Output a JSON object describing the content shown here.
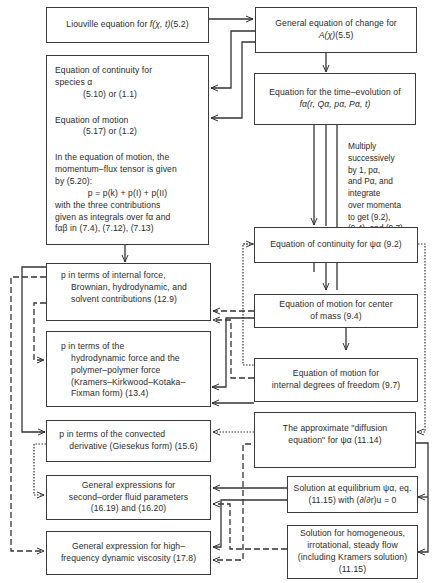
{
  "diagram": {
    "type": "flowchart",
    "nodes": {
      "liouville": {
        "text": "Liouville equation for",
        "sym": "f(χ, t)",
        "ref": "(5.2)"
      },
      "general_change": {
        "line1": "General equation of change for",
        "sym": "A(χ)",
        "ref": "(5.5)"
      },
      "continuity_species": {
        "line1": "Equation of continuity for",
        "line2": "species α",
        "ref": "(5.10) or (1.1)"
      },
      "motion": {
        "line1": "Equation of motion",
        "ref": "(5.17) or (1.2)"
      },
      "momentum_flux": {
        "line1": "In the equation of motion, the",
        "line2": "momentum–flux tensor is given",
        "line3": "by (5.20):",
        "formula": "p = p(k) + p(I) + p(II)",
        "line4": "with the three contributions",
        "line5": "given as integrals over fα and",
        "line6": "fαβ in (7.4), (7.12), (7.13)"
      },
      "time_evolution": {
        "line1": "Equation for the time–evolution of",
        "line2": "fα(r, Qα, pα, Pα, t)"
      },
      "multiply_note": {
        "lines": [
          "Multiply",
          "successively",
          "by 1, pα,",
          "and Pα, and",
          "integrate",
          "over momenta",
          "to get (9.2),",
          "(9.4), and (9.7)"
        ]
      },
      "p_internal": {
        "line1": "p in terms of internal force,",
        "line2": "Brownian, hydrodynamic, and",
        "line3": "solvent contributions (12.9)"
      },
      "continuity_psi": {
        "text": "Equation of continuity for ψα (9.2)"
      },
      "motion_center": {
        "line1": "Equation of motion for center",
        "line2": "of mass (9.4)"
      },
      "p_hydro": {
        "line1": "p in terms of the",
        "line2": "hydrodynamic force and the",
        "line3": "polymer–polymer force",
        "line4": "(Kramers–Kirkwood–Kotaka–",
        "line5": "Fixman form) (13.4)"
      },
      "motion_internal": {
        "line1": "Equation of motion for",
        "line2": "internal degrees of freedom (9.7)"
      },
      "p_convected": {
        "line1": "p in terms of the convected",
        "line2": "derivative (Giesekus form) (15.6)"
      },
      "diffusion": {
        "line1": "The approximate \"diffusion",
        "line2": "equation\" for ψα (11.14)"
      },
      "second_order": {
        "line1": "General expressions for",
        "line2": "second–order fluid parameters",
        "line3": "(16.19) and (16.20)"
      },
      "equilibrium": {
        "line1": "Solution at equilibrium ψα, eq.",
        "line2": "(11.15) with (∂/∂r)u = 0"
      },
      "high_freq": {
        "line1": "General expression for high–",
        "line2": "frequency dynamic viscosity (17.8)"
      },
      "homogeneous": {
        "line1": "Solution for homogeneous,",
        "line2": "irrotational, steady flow",
        "line3": "(including Kramers solution)(11.15)"
      }
    },
    "edges": [
      {
        "from": "liouville",
        "to": "general_change",
        "style": "solid"
      },
      {
        "from": "general_change",
        "to": "continuity_species",
        "style": "solid"
      },
      {
        "from": "general_change",
        "to": "motion",
        "style": "solid"
      },
      {
        "from": "general_change",
        "to": "time_evolution",
        "style": "solid"
      },
      {
        "from": "time_evolution",
        "to": "continuity_psi",
        "style": "solid"
      },
      {
        "from": "time_evolution",
        "to": "motion_center",
        "style": "solid"
      },
      {
        "from": "time_evolution",
        "to": "motion_internal",
        "style": "solid"
      },
      {
        "from": "momentum_flux",
        "to": "p_internal",
        "style": "solid"
      },
      {
        "from": "continuity_psi",
        "to": "motion_center",
        "style": "solid"
      },
      {
        "from": "motion_center",
        "to": "motion_internal",
        "style": "solid"
      },
      {
        "from": "continuity_psi",
        "to": "p_convected",
        "style": "dotted"
      },
      {
        "from": "continuity_psi",
        "to": "diffusion",
        "style": "dotted"
      },
      {
        "from": "motion_center",
        "to": "p_internal",
        "style": "dashed"
      },
      {
        "from": "motion_internal",
        "to": "p_internal",
        "style": "dashed"
      },
      {
        "from": "motion_internal",
        "to": "p_hydro",
        "style": "solid"
      },
      {
        "from": "motion_center",
        "to": "p_hydro",
        "style": "solid"
      },
      {
        "from": "p_internal",
        "to": "high_freq",
        "style": "dashed"
      },
      {
        "from": "p_internal",
        "to": "p_convected",
        "style": "solid"
      },
      {
        "from": "p_internal",
        "to": "p_hydro",
        "style": "dashed"
      },
      {
        "from": "p_convected",
        "to": "second_order",
        "style": "dotted"
      },
      {
        "from": "diffusion",
        "to": "equilibrium",
        "style": "solid"
      },
      {
        "from": "diffusion",
        "to": "homogeneous",
        "style": "solid"
      },
      {
        "from": "equilibrium",
        "to": "second_order",
        "style": "solid"
      },
      {
        "from": "equilibrium",
        "to": "high_freq",
        "style": "solid"
      },
      {
        "from": "homogeneous",
        "to": "second_order",
        "style": "dashed"
      },
      {
        "from": "diffusion",
        "to": "high_freq",
        "style": "dashed"
      }
    ]
  }
}
